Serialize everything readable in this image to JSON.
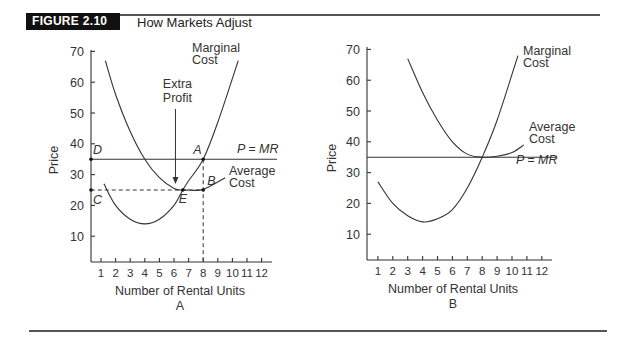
{
  "figure": {
    "badge": "FIGURE 2.10",
    "title": "How Markets Adjust"
  },
  "chart_data": [
    {
      "type": "line",
      "panel": "A",
      "title": "",
      "xlabel": "Number of Rental Units",
      "ylabel": "Price",
      "caption": "A",
      "xticks": [
        "1",
        "2",
        "3",
        "4",
        "5",
        "6",
        "7",
        "8",
        "9",
        "10",
        "11",
        "12"
      ],
      "yticks": [
        "10",
        "20",
        "30",
        "40",
        "50",
        "60",
        "70"
      ],
      "xlim": [
        0,
        12.5
      ],
      "ylim": [
        0,
        72
      ],
      "grid": false,
      "series": [
        {
          "name": "Marginal Cost",
          "label_lines": [
            "Marginal",
            "Cost"
          ],
          "x": [
            1.2,
            2,
            3,
            4,
            5,
            6,
            6.6,
            7,
            8,
            9,
            10.4
          ],
          "y": [
            27,
            20,
            15.5,
            14,
            15.5,
            20,
            25,
            28,
            35,
            47,
            67
          ]
        },
        {
          "name": "Average Cost",
          "label_lines": [
            "Average",
            "Cost"
          ],
          "x": [
            1.3,
            2,
            3,
            4,
            5,
            6,
            6.6,
            7,
            8,
            9.5
          ],
          "y": [
            67,
            56,
            44,
            35,
            29,
            25.5,
            25,
            25,
            25.2,
            29
          ]
        },
        {
          "name": "P = MR",
          "x": [
            0.3,
            12.5
          ],
          "y": [
            35,
            35
          ]
        }
      ],
      "annotations": [
        {
          "label": "A",
          "x": 8,
          "y": 35
        },
        {
          "label": "B",
          "x": 8,
          "y": 25
        },
        {
          "label": "C",
          "x": 0.3,
          "y": 25
        },
        {
          "label": "D",
          "x": 0.3,
          "y": 35
        },
        {
          "label": "E",
          "x": 6.6,
          "y": 25
        },
        {
          "label": "Extra Profit",
          "label_lines": [
            "Extra",
            "Profit"
          ],
          "x": 6.1,
          "y": 26,
          "arrow": true
        }
      ],
      "reference_lines": [
        {
          "type": "dashed",
          "from": [
            0.3,
            25
          ],
          "to": [
            8,
            25
          ]
        },
        {
          "type": "dashed",
          "from": [
            8,
            35
          ],
          "to": [
            8,
            0
          ]
        }
      ]
    },
    {
      "type": "line",
      "panel": "B",
      "title": "",
      "xlabel": "Number of Rental Units",
      "ylabel": "Price",
      "caption": "B",
      "xticks": [
        "1",
        "2",
        "3",
        "4",
        "5",
        "6",
        "7",
        "8",
        "9",
        "10",
        "11",
        "12"
      ],
      "yticks": [
        "10",
        "20",
        "30",
        "40",
        "50",
        "60",
        "70"
      ],
      "xlim": [
        0,
        12.5
      ],
      "ylim": [
        0,
        72
      ],
      "grid": false,
      "series": [
        {
          "name": "Marginal Cost",
          "label_lines": [
            "Marginal",
            "Cost"
          ],
          "x": [
            1,
            2,
            3,
            4,
            5,
            6,
            7,
            8,
            9,
            10.4
          ],
          "y": [
            27,
            20,
            16,
            14,
            15,
            18,
            25,
            35,
            47,
            68
          ]
        },
        {
          "name": "Average Cost",
          "label_lines": [
            "Average",
            "Cost"
          ],
          "x": [
            3,
            4,
            5,
            6,
            7,
            8,
            9,
            10,
            10.8
          ],
          "y": [
            67,
            56,
            47,
            40,
            36,
            35,
            35.3,
            36.5,
            39
          ]
        },
        {
          "name": "P = MR",
          "x": [
            0.3,
            12.5
          ],
          "y": [
            35,
            35
          ]
        }
      ]
    }
  ]
}
